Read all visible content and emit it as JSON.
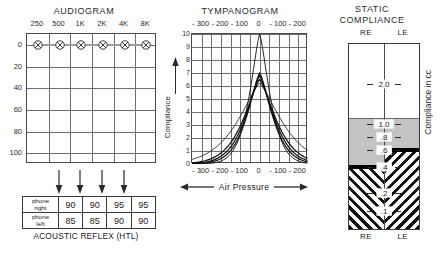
{
  "audiogram": {
    "title": "AUDIOGRAM",
    "frequencies": [
      "250",
      "500",
      "1K",
      "2K",
      "4K",
      "8K"
    ],
    "db_labels": [
      "0",
      "20",
      "40",
      "60",
      "80",
      "100"
    ],
    "db_min": -10,
    "db_max": 110,
    "thresholds_right": [
      0,
      0,
      0,
      0,
      0,
      0
    ],
    "thresholds_left": [
      0,
      0,
      0,
      0,
      0,
      0
    ],
    "symbol_right": "circle-o-right-ear",
    "symbol_left": "x-cross-left-ear"
  },
  "reflex": {
    "caption": "ACOUSTIC REFLEX (HTL)",
    "row_labels": [
      "phone right",
      "phone left"
    ],
    "row_label_right_line1": "phone",
    "row_label_right_line2": "right",
    "row_label_left_line1": "phone",
    "row_label_left_line2": "left",
    "values_right": [
      "90",
      "90",
      "95",
      "95"
    ],
    "values_left": [
      "85",
      "85",
      "90",
      "90"
    ],
    "arrow_columns": [
      1,
      2,
      3,
      4
    ]
  },
  "tympanogram": {
    "title": "TYMPANOGRAM",
    "pressure_labels": [
      "- 300",
      "- 200",
      "- 100",
      "0",
      "- 100",
      "- 200"
    ],
    "compliance_labels": [
      "10",
      "9",
      "8",
      "7",
      "6",
      "5",
      "4",
      "3",
      "2",
      "1",
      "0"
    ],
    "y_axis_label": "Compliance",
    "x_axis_label": "Air Pressure",
    "y_axis_arrow": "up-arrow-icon",
    "x_axis_arrow_left": "left-arrow-icon",
    "x_axis_arrow_right": "right-arrow-icon"
  },
  "static_compliance": {
    "title_line1": "STATIC",
    "title_line2": "COMPLIANCE",
    "header_left": "RE",
    "header_right": "LE",
    "footer_left": "RE",
    "footer_right": "LE",
    "y_axis_label": "Compliance in cc",
    "scale_labels": [
      "2.0",
      "1.0",
      ".8",
      ".6",
      ".4",
      ".2",
      ".1"
    ],
    "value_right": ".4",
    "value_left": ".6",
    "normal_band_low": ".3",
    "normal_band_high": "1.05"
  },
  "chart_data": [
    {
      "type": "line",
      "title": "AUDIOGRAM",
      "xlabel": "Frequency (Hz)",
      "ylabel": "Hearing Level (dB HTL)",
      "categories": [
        "250",
        "500",
        "1K",
        "2K",
        "4K",
        "8K"
      ],
      "ylim": [
        -10,
        110
      ],
      "y_inverted": true,
      "yticks": [
        0,
        20,
        40,
        60,
        80,
        100
      ],
      "grid": true,
      "series": [
        {
          "name": "Right ear (air conduction)",
          "symbol": "O",
          "values": [
            0,
            0,
            0,
            0,
            0,
            0
          ]
        },
        {
          "name": "Left ear (air conduction)",
          "symbol": "X",
          "values": [
            0,
            0,
            0,
            0,
            0,
            0
          ]
        }
      ],
      "annotations": [
        "All thresholds at 0 dB HTL — normal hearing sensitivity"
      ]
    },
    {
      "type": "table",
      "title": "ACOUSTIC REFLEX (HTL)",
      "row_headers": [
        "phone right",
        "phone left"
      ],
      "columns": [
        "500",
        "1K",
        "2K",
        "4K"
      ],
      "rows": [
        [
          "90",
          "90",
          "95",
          "95"
        ],
        [
          "85",
          "85",
          "90",
          "90"
        ]
      ]
    },
    {
      "type": "line",
      "title": "TYMPANOGRAM",
      "xlabel": "Air Pressure",
      "ylabel": "Compliance",
      "xticks": [
        -300,
        -200,
        -100,
        0,
        -100,
        -200
      ],
      "xlim": [
        -300,
        -200
      ],
      "ylim": [
        0,
        10
      ],
      "yticks": [
        0,
        1,
        2,
        3,
        4,
        5,
        6,
        7,
        8,
        9,
        10
      ],
      "grid": true,
      "legend": "none",
      "series": [
        {
          "name": "Curve 1 (tall, peak 10)",
          "peak_pressure": 0,
          "peak_compliance": 10
        },
        {
          "name": "Curve 2 (peak 7.0)",
          "peak_pressure": 0,
          "peak_compliance": 7.0
        },
        {
          "name": "Curve 3 (peak 6.8)",
          "peak_pressure": 0,
          "peak_compliance": 6.8
        },
        {
          "name": "Curve 4 (peak 6.5)",
          "peak_pressure": 0,
          "peak_compliance": 6.5
        },
        {
          "name": "Curve 5 (broad, peak 6.2)",
          "peak_pressure": 0,
          "peak_compliance": 6.2
        }
      ],
      "annotations": [
        "Type A tympanograms, all peaking at 0 daPa"
      ]
    },
    {
      "type": "bar",
      "title": "STATIC COMPLIANCE",
      "ylabel": "Compliance in cc",
      "categories": [
        "RE",
        "LE"
      ],
      "values": [
        0.4,
        0.6
      ],
      "ylim": [
        0,
        2.4
      ],
      "yticks": [
        0.1,
        0.2,
        0.4,
        0.6,
        0.8,
        1.0,
        2.0
      ],
      "normal_range": [
        0.3,
        1.05
      ],
      "annotations": [
        "RE = .4 cc",
        "LE = .6 cc",
        "Shaded band = normal range"
      ]
    }
  ]
}
